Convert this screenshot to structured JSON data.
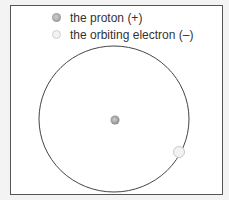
{
  "legend": {
    "items": [
      {
        "label": "the proton (+)",
        "icon": "proton-dot-icon"
      },
      {
        "label": "the orbiting electron (–)",
        "icon": "electron-dot-icon"
      }
    ]
  },
  "diagram": {
    "orbit": {
      "cx": 114,
      "cy": 119,
      "rx": 75,
      "ry": 73,
      "stroke": "#444444"
    },
    "proton": {
      "cx": 115,
      "cy": 120,
      "r": 4.5,
      "fill": "#a0a0a0"
    },
    "electron": {
      "cx": 179,
      "cy": 152,
      "r": 5.5,
      "fill": "#f0f0f0"
    }
  }
}
